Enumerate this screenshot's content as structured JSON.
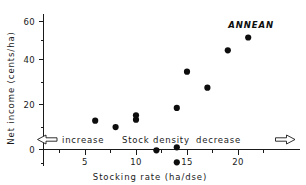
{
  "chart_data": {
    "type": "scatter",
    "title": "",
    "xlabel": "Stocking rate  (ha/dse)",
    "ylabel": "Net income  (cents/ha)",
    "xlim": [
      1.8,
      21.8
    ],
    "ylim": [
      -8,
      62
    ],
    "grid": false,
    "legend": "none",
    "x_ticks_major": [
      5,
      10,
      15,
      20
    ],
    "x_ticks_major_labels": [
      "5",
      "10",
      "15",
      "20"
    ],
    "x_ticks_minor": [
      2.5,
      7.5,
      12.5,
      17.5
    ],
    "y_ticks_major": [
      0,
      20,
      40,
      60
    ],
    "y_ticks_major_labels": [
      "0",
      "20",
      "40",
      "60"
    ],
    "y_ticks_minor": [
      10,
      30,
      50
    ],
    "series": [
      {
        "name": "ANNEAN",
        "marker": "filled-circle",
        "color": "#0d0d0d",
        "points": [
          {
            "x": 6.0,
            "y": 13.5
          },
          {
            "x": 8.0,
            "y": 10.5
          },
          {
            "x": 10.0,
            "y": 16.0
          },
          {
            "x": 10.0,
            "y": 14.0
          },
          {
            "x": 12.0,
            "y": -0.4
          },
          {
            "x": 14.0,
            "y": 19.5
          },
          {
            "x": 14.0,
            "y": 1.0
          },
          {
            "x": 14.0,
            "y": -6.0
          },
          {
            "x": 15.0,
            "y": 36.5
          },
          {
            "x": 17.0,
            "y": 29.0
          },
          {
            "x": 19.0,
            "y": 46.5
          },
          {
            "x": 21.0,
            "y": 52.5
          }
        ]
      }
    ],
    "annotations": [
      {
        "name": "series-label",
        "text": "ANNEAN",
        "x": 18.6,
        "y": 53.0
      },
      {
        "name": "band-increase",
        "text": "increase",
        "x": 5.2,
        "y": 4.2
      },
      {
        "name": "band-middle",
        "text": "Stock  density",
        "x": 9.6,
        "y": 4.2
      },
      {
        "name": "band-decrease",
        "text": "decrease",
        "x": 15.9,
        "y": 4.2
      },
      {
        "name": "arrow-left",
        "text": "left-arrow",
        "x": 3.0,
        "y": 4.2
      },
      {
        "name": "arrow-right",
        "text": "right-arrow",
        "x": 20.2,
        "y": 4.2
      }
    ]
  },
  "labels": {
    "y_axis_title": "Net income  (cents/ha)",
    "x_axis_title": "Stocking rate  (ha/dse)",
    "series_name": "ANNEAN",
    "band_increase": "increase",
    "band_middle": "Stock  density",
    "band_decrease": "decrease",
    "y_tick_0": "0",
    "y_tick_20": "20",
    "y_tick_40": "40",
    "y_tick_60": "60",
    "x_tick_5": "5",
    "x_tick_10": "10",
    "x_tick_15": "15",
    "x_tick_20": "20"
  },
  "colors": {
    "marker": "#0d0d0d",
    "axis": "#1a1a1a",
    "background": "#ffffff"
  }
}
